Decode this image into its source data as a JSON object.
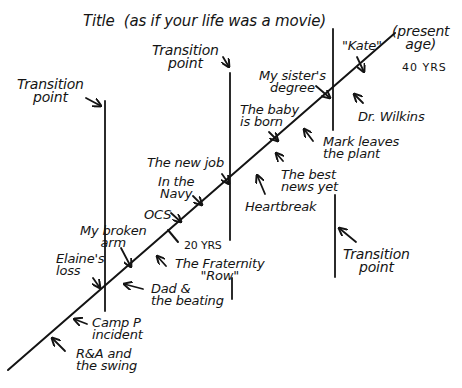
{
  "diagram": {
    "title": "Title  (as if your life was a movie)",
    "ink_color": "#141414",
    "background": "#ffffff",
    "timeline": {
      "start": [
        8,
        370
      ],
      "end": [
        395,
        33
      ],
      "present_label": "(present\nage)",
      "present_age": "40 YRS",
      "midpoint_label": "20 YRS"
    },
    "transition_points": [
      {
        "label": "Transition\npoint",
        "position": "left"
      },
      {
        "label": "Transition\npoint",
        "position": "middle"
      },
      {
        "label": "Transition\npoint",
        "position": "right-bottom"
      }
    ],
    "events": [
      {
        "label": "R&A and\nthe swing",
        "side": "below"
      },
      {
        "label": "Camp P\nincident",
        "side": "below"
      },
      {
        "label": "Elaine's\nloss",
        "side": "above"
      },
      {
        "label": "Dad &\nthe beating",
        "side": "below"
      },
      {
        "label": "My broken\narm",
        "side": "above"
      },
      {
        "label": "The Fraternity\n\"Row\"",
        "side": "below"
      },
      {
        "label": "OCS",
        "side": "above"
      },
      {
        "label": "In the\nNavy",
        "side": "above"
      },
      {
        "label": "The new job",
        "side": "above"
      },
      {
        "label": "Heartbreak",
        "side": "below"
      },
      {
        "label": "The best\nnews yet",
        "side": "below"
      },
      {
        "label": "The baby\nis born",
        "side": "above"
      },
      {
        "label": "Mark leaves\nthe plant",
        "side": "below"
      },
      {
        "label": "My sister's\ndegree",
        "side": "above"
      },
      {
        "label": "Dr. Wilkins",
        "side": "below"
      },
      {
        "label": "\"Kate\"",
        "side": "above"
      }
    ]
  }
}
